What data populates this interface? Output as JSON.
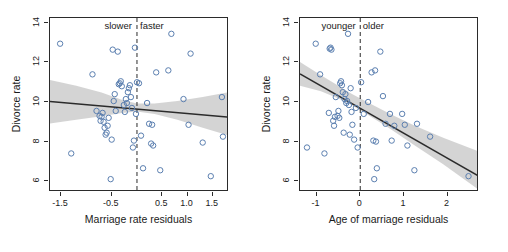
{
  "figure": {
    "background": "#ffffff",
    "marker_color": "#5b7fb0",
    "line_color": "#2b2b2b",
    "band_color": "#d2d2d2",
    "axis_color": "#2b2b2b"
  },
  "chart_data": [
    {
      "type": "scatter",
      "id": "left-panel",
      "title": "",
      "xlabel": "Marriage rate residuals",
      "ylabel": "Divorce rate",
      "xlim": [
        -1.72,
        1.82
      ],
      "ylim": [
        5.45,
        14.25
      ],
      "xticks": [
        -1.5,
        -0.5,
        0.5,
        1.0,
        1.5
      ],
      "xticklabels": [
        "-1.5",
        "-0.5",
        "0.5",
        "1.0",
        "1.5"
      ],
      "yticks": [
        6,
        8,
        10,
        12,
        14
      ],
      "yticklabels": [
        "6",
        "8",
        "10",
        "12",
        "14"
      ],
      "grid": false,
      "legend": "none",
      "annotations": [
        {
          "text": "slower",
          "x": -0.08,
          "y": 14.0,
          "align": "right"
        },
        {
          "text": "faster",
          "x": 0.08,
          "y": 14.0,
          "align": "left"
        }
      ],
      "vline": {
        "x": 0,
        "style": "dashed"
      },
      "fit_line": {
        "x": [
          -1.72,
          1.82
        ],
        "y": [
          10.03,
          9.24
        ]
      },
      "ci_band": {
        "x": [
          -1.72,
          -1.2,
          -0.7,
          -0.3,
          0.0,
          0.35,
          0.8,
          1.3,
          1.82
        ],
        "upper": [
          11.12,
          10.82,
          10.48,
          10.11,
          9.92,
          9.92,
          10.05,
          10.25,
          10.5
        ],
        "lower": [
          8.92,
          9.1,
          9.28,
          9.45,
          9.52,
          9.4,
          9.1,
          8.7,
          8.3
        ]
      },
      "points": [
        {
          "x": -1.52,
          "y": 12.95
        },
        {
          "x": -1.3,
          "y": 7.4
        },
        {
          "x": -0.88,
          "y": 11.4
        },
        {
          "x": -0.8,
          "y": 9.55
        },
        {
          "x": -0.74,
          "y": 9.3
        },
        {
          "x": -0.72,
          "y": 9.05
        },
        {
          "x": -0.7,
          "y": 9.25
        },
        {
          "x": -0.68,
          "y": 9.45
        },
        {
          "x": -0.66,
          "y": 9.0
        },
        {
          "x": -0.64,
          "y": 8.7
        },
        {
          "x": -0.62,
          "y": 8.35
        },
        {
          "x": -0.6,
          "y": 8.45
        },
        {
          "x": -0.58,
          "y": 8.8
        },
        {
          "x": -0.56,
          "y": 9.2
        },
        {
          "x": -0.52,
          "y": 6.1
        },
        {
          "x": -0.5,
          "y": 8.1
        },
        {
          "x": -0.48,
          "y": 12.65
        },
        {
          "x": -0.46,
          "y": 10.05
        },
        {
          "x": -0.44,
          "y": 10.4
        },
        {
          "x": -0.42,
          "y": 9.55
        },
        {
          "x": -0.38,
          "y": 12.55
        },
        {
          "x": -0.36,
          "y": 10.9
        },
        {
          "x": -0.34,
          "y": 10.95
        },
        {
          "x": -0.32,
          "y": 11.05
        },
        {
          "x": -0.3,
          "y": 10.8
        },
        {
          "x": -0.26,
          "y": 9.85
        },
        {
          "x": -0.24,
          "y": 9.5
        },
        {
          "x": -0.22,
          "y": 10.15
        },
        {
          "x": -0.2,
          "y": 9.95
        },
        {
          "x": -0.18,
          "y": 10.5
        },
        {
          "x": -0.16,
          "y": 10.7
        },
        {
          "x": -0.14,
          "y": 10.85
        },
        {
          "x": -0.12,
          "y": 10.25
        },
        {
          "x": -0.1,
          "y": 9.7
        },
        {
          "x": -0.08,
          "y": 7.7
        },
        {
          "x": -0.06,
          "y": 8.05
        },
        {
          "x": -0.04,
          "y": 12.75
        },
        {
          "x": -0.02,
          "y": 9.4
        },
        {
          "x": 0.0,
          "y": 11.0
        },
        {
          "x": 0.04,
          "y": 10.95
        },
        {
          "x": 0.08,
          "y": 8.3
        },
        {
          "x": 0.12,
          "y": 6.65
        },
        {
          "x": 0.2,
          "y": 9.95
        },
        {
          "x": 0.24,
          "y": 8.9
        },
        {
          "x": 0.28,
          "y": 7.9
        },
        {
          "x": 0.3,
          "y": 8.85
        },
        {
          "x": 0.32,
          "y": 7.8
        },
        {
          "x": 0.38,
          "y": 11.5
        },
        {
          "x": 0.46,
          "y": 6.55
        },
        {
          "x": 0.62,
          "y": 11.6
        },
        {
          "x": 0.68,
          "y": 13.45
        },
        {
          "x": 0.92,
          "y": 10.15
        },
        {
          "x": 1.02,
          "y": 8.85
        },
        {
          "x": 1.06,
          "y": 12.45
        },
        {
          "x": 1.3,
          "y": 7.95
        },
        {
          "x": 1.46,
          "y": 6.25
        },
        {
          "x": 1.68,
          "y": 10.25
        },
        {
          "x": 1.7,
          "y": 8.25
        }
      ]
    },
    {
      "type": "scatter",
      "id": "right-panel",
      "title": "",
      "xlabel": "Age of marriage residuals",
      "ylabel": "Divorce rate",
      "xlim": [
        -1.38,
        2.72
      ],
      "ylim": [
        5.45,
        14.25
      ],
      "xticks": [
        -1,
        0,
        1,
        2
      ],
      "xticklabels": [
        "-1",
        "0",
        "1",
        "2"
      ],
      "yticks": [
        6,
        8,
        10,
        12,
        14
      ],
      "yticklabels": [
        "6",
        "8",
        "10",
        "12",
        "14"
      ],
      "grid": false,
      "legend": "none",
      "annotations": [
        {
          "text": "younger",
          "x": -0.08,
          "y": 14.0,
          "align": "right"
        },
        {
          "text": "older",
          "x": 0.08,
          "y": 14.0,
          "align": "left"
        }
      ],
      "vline": {
        "x": 0,
        "style": "dashed"
      },
      "fit_line": {
        "x": [
          -1.38,
          2.72
        ],
        "y": [
          11.42,
          6.25
        ]
      },
      "ci_band": {
        "x": [
          -1.38,
          -0.9,
          -0.5,
          -0.2,
          0.2,
          0.7,
          1.25,
          1.9,
          2.72
        ],
        "upper": [
          12.02,
          11.35,
          10.82,
          10.42,
          9.95,
          9.38,
          8.8,
          8.2,
          7.5
        ],
        "lower": [
          10.82,
          10.55,
          10.18,
          9.85,
          9.32,
          8.62,
          7.8,
          6.85,
          5.55
        ]
      },
      "points": [
        {
          "x": -1.22,
          "y": 7.7
        },
        {
          "x": -1.02,
          "y": 12.95
        },
        {
          "x": -0.92,
          "y": 11.4
        },
        {
          "x": -0.82,
          "y": 7.4
        },
        {
          "x": -0.72,
          "y": 9.45
        },
        {
          "x": -0.7,
          "y": 12.7
        },
        {
          "x": -0.68,
          "y": 12.75
        },
        {
          "x": -0.66,
          "y": 12.65
        },
        {
          "x": -0.62,
          "y": 9.05
        },
        {
          "x": -0.6,
          "y": 8.8
        },
        {
          "x": -0.58,
          "y": 9.25
        },
        {
          "x": -0.56,
          "y": 10.25
        },
        {
          "x": -0.52,
          "y": 9.3
        },
        {
          "x": -0.5,
          "y": 9.55
        },
        {
          "x": -0.48,
          "y": 9.2
        },
        {
          "x": -0.46,
          "y": 10.95
        },
        {
          "x": -0.44,
          "y": 11.05
        },
        {
          "x": -0.42,
          "y": 10.85
        },
        {
          "x": -0.4,
          "y": 10.5
        },
        {
          "x": -0.38,
          "y": 8.45
        },
        {
          "x": -0.36,
          "y": 10.15
        },
        {
          "x": -0.34,
          "y": 10.4
        },
        {
          "x": -0.32,
          "y": 9.95
        },
        {
          "x": -0.3,
          "y": 10.05
        },
        {
          "x": -0.28,
          "y": 13.45
        },
        {
          "x": -0.26,
          "y": 9.85
        },
        {
          "x": -0.24,
          "y": 8.35
        },
        {
          "x": -0.22,
          "y": 10.7
        },
        {
          "x": -0.2,
          "y": 9.5
        },
        {
          "x": -0.18,
          "y": 8.85
        },
        {
          "x": -0.14,
          "y": 8.1
        },
        {
          "x": -0.1,
          "y": 9.7
        },
        {
          "x": -0.06,
          "y": 7.7
        },
        {
          "x": 0.02,
          "y": 11.0
        },
        {
          "x": 0.08,
          "y": 9.4
        },
        {
          "x": 0.18,
          "y": 10.0
        },
        {
          "x": 0.26,
          "y": 11.5
        },
        {
          "x": 0.3,
          "y": 8.05
        },
        {
          "x": 0.32,
          "y": 6.1
        },
        {
          "x": 0.34,
          "y": 11.6
        },
        {
          "x": 0.36,
          "y": 8.0
        },
        {
          "x": 0.38,
          "y": 6.65
        },
        {
          "x": 0.46,
          "y": 12.55
        },
        {
          "x": 0.52,
          "y": 10.3
        },
        {
          "x": 0.58,
          "y": 8.9
        },
        {
          "x": 0.68,
          "y": 9.4
        },
        {
          "x": 0.72,
          "y": 8.05
        },
        {
          "x": 0.78,
          "y": 8.8
        },
        {
          "x": 0.96,
          "y": 9.4
        },
        {
          "x": 1.02,
          "y": 8.85
        },
        {
          "x": 1.08,
          "y": 7.8
        },
        {
          "x": 1.24,
          "y": 6.55
        },
        {
          "x": 1.3,
          "y": 8.9
        },
        {
          "x": 1.6,
          "y": 8.25
        },
        {
          "x": 2.48,
          "y": 6.25
        }
      ]
    }
  ]
}
